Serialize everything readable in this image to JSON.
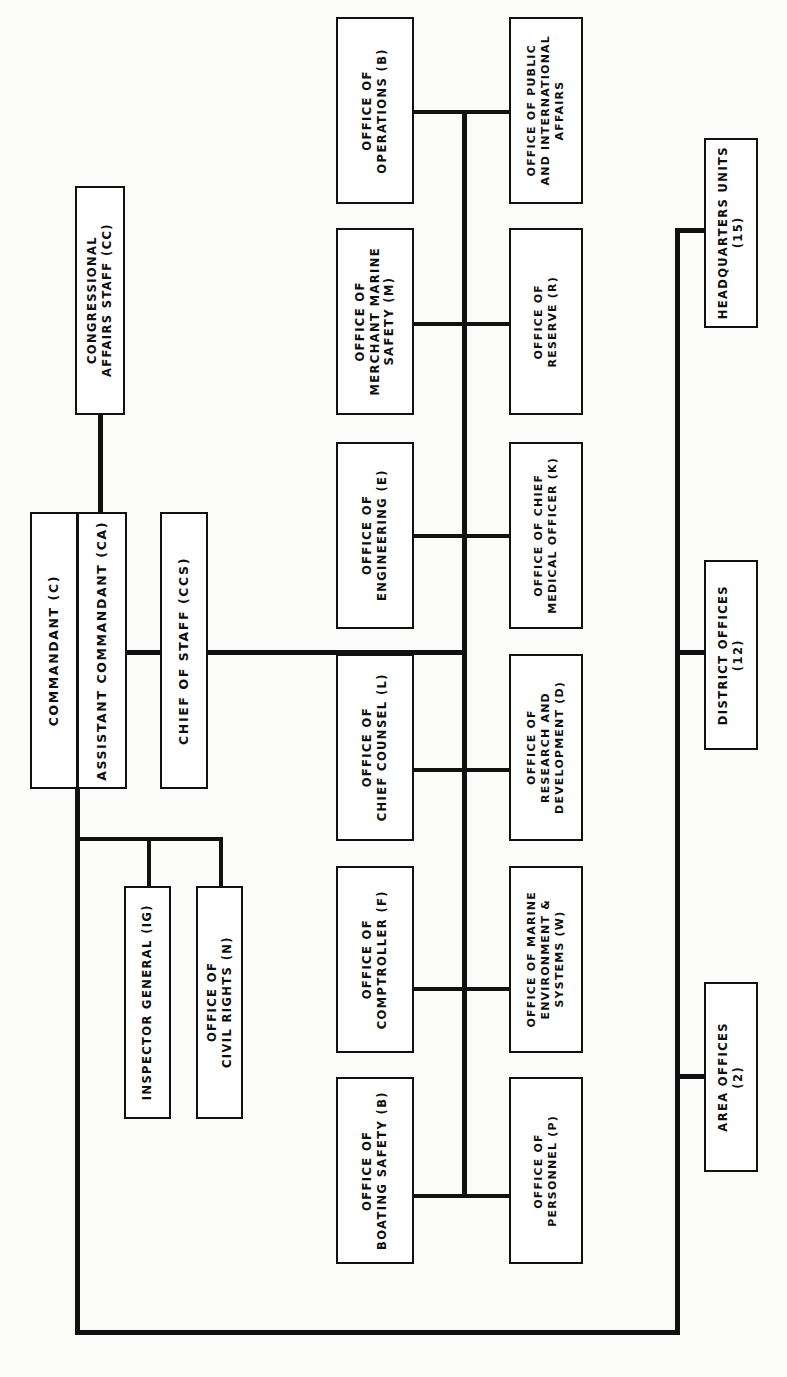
{
  "chart": {
    "orientation": "rotated-90-ccw",
    "line_color": "#111111",
    "box_fill": "#ffffff",
    "page_background": "#fbfbf9"
  },
  "nodes": {
    "congressional_affairs": {
      "label": "CONGRESSIONAL\nAFFAIRS STAFF (CC)"
    },
    "commandant": {
      "label": "COMMANDANT (C)"
    },
    "assistant_commandant": {
      "label": "ASSISTANT COMMANDANT (CA)"
    },
    "chief_of_staff": {
      "label": "CHIEF OF STAFF (CCS)"
    },
    "inspector_general": {
      "label": "INSPECTOR GENERAL (IG)"
    },
    "civil_rights": {
      "label": "OFFICE OF\nCIVIL RIGHTS (N)"
    },
    "operations": {
      "label": "OFFICE OF\nOPERATIONS (B)"
    },
    "merchant_marine_safety": {
      "label": "OFFICE OF\nMERCHANT MARINE\nSAFETY (M)"
    },
    "engineering": {
      "label": "OFFICE OF\nENGINEERING (E)"
    },
    "chief_counsel": {
      "label": "OFFICE OF\nCHIEF COUNSEL (L)"
    },
    "comptroller": {
      "label": "OFFICE OF\nCOMPTROLLER (F)"
    },
    "boating_safety": {
      "label": "OFFICE OF\nBOATING SAFETY (B)"
    },
    "public_international_affairs": {
      "label": "OFFICE OF PUBLIC\nAND INTERNATIONAL\nAFFAIRS"
    },
    "reserve": {
      "label": "OFFICE OF\nRESERVE (R)"
    },
    "chief_medical_officer": {
      "label": "OFFICE OF CHIEF\nMEDICAL OFFICER (K)"
    },
    "research_development": {
      "label": "OFFICE OF\nRESEARCH AND\nDEVELOPMENT (D)"
    },
    "marine_environment_systems": {
      "label": "OFFICE OF MARINE\nENVIRONMENT &\nSYSTEMS (W)"
    },
    "personnel": {
      "label": "OFFICE OF\nPERSONNEL (P)"
    },
    "headquarters_units": {
      "label": "HEADQUARTERS UNITS\n(15)"
    },
    "district_offices": {
      "label": "DISTRICT OFFICES\n(12)"
    },
    "area_offices": {
      "label": "AREA OFFICES\n(2)"
    }
  }
}
